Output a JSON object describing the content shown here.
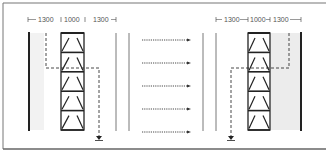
{
  "diagram": {
    "type": "warehouse-aisle-plan",
    "left_dimensions": [
      "1300",
      "1000",
      "1300"
    ],
    "right_dimensions": [
      "1300",
      "1000",
      "1300"
    ],
    "left_rack": {
      "cells": 5
    },
    "right_rack": {
      "cells": 5
    },
    "center_flow_arrows": 5,
    "colors": {
      "line": "#222222",
      "thin_line": "#555555",
      "shade": "#ececec",
      "frame": "#777777"
    }
  }
}
